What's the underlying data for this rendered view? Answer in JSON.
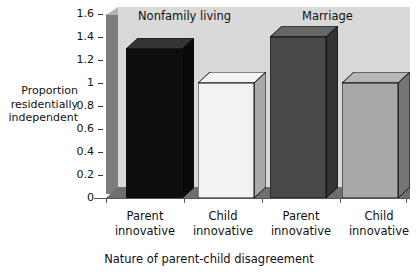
{
  "chart_data": {
    "type": "bar",
    "title": "",
    "xlabel": "Nature of parent-child disagreement",
    "ylabel": "Proportion residentially independent",
    "ylabel_lines": [
      "Proportion",
      "residentially",
      "independent"
    ],
    "ylim": [
      0,
      1.6
    ],
    "yticks": [
      "1.6",
      "1.4",
      "1.2",
      "1",
      "0.8",
      "0.6",
      "0.4",
      "0.2",
      "0"
    ],
    "ytick_values": [
      1.6,
      1.4,
      1.2,
      1.0,
      0.8,
      0.6,
      0.4,
      0.2,
      0
    ],
    "grid": false,
    "legend": "none",
    "group_headers": [
      "Nonfamily living",
      "Marriage"
    ],
    "categories": [
      "Parent innovative",
      "Child innovative",
      "Parent innovative",
      "Child innovative"
    ],
    "category_lines": [
      [
        "Parent",
        "innovative"
      ],
      [
        "Child",
        "innovative"
      ],
      [
        "Parent",
        "innovative"
      ],
      [
        "Child",
        "innovative"
      ]
    ],
    "values": [
      1.3,
      1.0,
      1.4,
      1.0
    ],
    "bars": [
      {
        "group": "Nonfamily living",
        "category": "Parent innovative",
        "value": 1.3,
        "color": "#0d0d0d"
      },
      {
        "group": "Nonfamily living",
        "category": "Child innovative",
        "value": 1.0,
        "color": "#f2f2f2"
      },
      {
        "group": "Marriage",
        "category": "Parent innovative",
        "value": 1.4,
        "color": "#494949"
      },
      {
        "group": "Marriage",
        "category": "Child innovative",
        "value": 1.0,
        "color": "#a8a8a8"
      }
    ],
    "colors": {
      "plot_background": "#d9d9d9",
      "left_wall": "#7c7c7c",
      "floor": "#6e6e6e",
      "axis": "#555555",
      "text": "#111111"
    }
  }
}
